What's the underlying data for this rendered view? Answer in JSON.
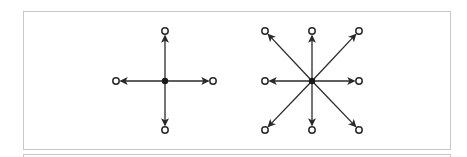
{
  "figure": {
    "colors": {
      "stroke": "#2a2a2a",
      "center": "#1a1a1a",
      "endpoint_fill": "#ffffff",
      "frame": "#c8c8c8"
    },
    "panels": [
      {
        "name": "four-connectivity",
        "center": [
          165,
          81
        ],
        "neighbors": [
          {
            "dir": "up",
            "point": [
              165,
              31
            ]
          },
          {
            "dir": "right",
            "point": [
              213,
              81
            ]
          },
          {
            "dir": "down",
            "point": [
              165,
              130
            ]
          },
          {
            "dir": "left",
            "point": [
              116,
              81
            ]
          }
        ]
      },
      {
        "name": "eight-connectivity",
        "center": [
          312,
          81
        ],
        "neighbors": [
          {
            "dir": "up",
            "point": [
              312,
              31
            ]
          },
          {
            "dir": "up-right",
            "point": [
              359,
              31
            ]
          },
          {
            "dir": "right",
            "point": [
              359,
              81
            ]
          },
          {
            "dir": "down-right",
            "point": [
              359,
              130
            ]
          },
          {
            "dir": "down",
            "point": [
              312,
              130
            ]
          },
          {
            "dir": "down-left",
            "point": [
              265,
              130
            ]
          },
          {
            "dir": "left",
            "point": [
              265,
              81
            ]
          },
          {
            "dir": "up-left",
            "point": [
              265,
              31
            ]
          }
        ]
      }
    ]
  }
}
